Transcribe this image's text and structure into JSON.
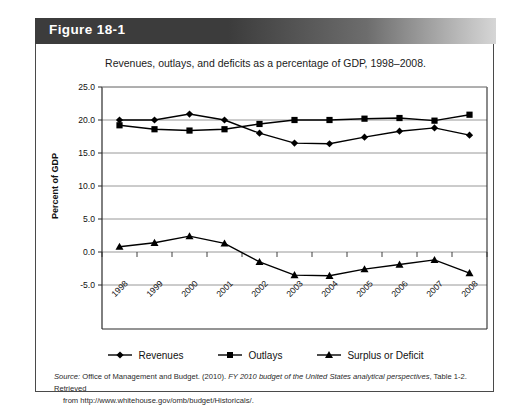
{
  "figure": {
    "label": "Figure 18-1",
    "caption": "Revenues, outlays, and deficits as a percentage of GDP, 1998–2008."
  },
  "source": {
    "prefix": "Source:",
    "text_before_title": " Office of Management and Budget. (2010). ",
    "title": "FY 2010 budget of the United States analytical perspectives",
    "text_after_title": ", Table 1-2. Retrieved",
    "line2": "from http://www.whitehouse.gov/omb/budget/Historicals/."
  },
  "legend": {
    "items": [
      {
        "label": "Revenues",
        "marker": "diamond",
        "color": "#000000"
      },
      {
        "label": "Outlays",
        "marker": "square",
        "color": "#000000"
      },
      {
        "label": "Surplus or Deficit",
        "marker": "triangle",
        "color": "#000000"
      }
    ]
  },
  "axes": {
    "y_label": "Percent of GDP",
    "y_ticks": [
      "25.0",
      "20.0",
      "15.0",
      "10.0",
      "5.0",
      "0.0",
      "-5.0"
    ],
    "x_ticks": [
      "1998",
      "1999",
      "2000",
      "2001",
      "2002",
      "2003",
      "2004",
      "2005",
      "2006",
      "2007",
      "2008"
    ]
  },
  "chart_data": {
    "type": "line",
    "title": "Revenues, outlays, and deficits as a percentage of GDP, 1998–2008.",
    "xlabel": "",
    "ylabel": "Percent of GDP",
    "ylim": [
      -5.0,
      25.0
    ],
    "ytick_step": 5.0,
    "grid": true,
    "legend_position": "bottom",
    "categories": [
      "1998",
      "1999",
      "2000",
      "2001",
      "2002",
      "2003",
      "2004",
      "2005",
      "2006",
      "2007",
      "2008"
    ],
    "series": [
      {
        "name": "Revenues",
        "marker": "diamond",
        "values": [
          20.0,
          20.0,
          20.9,
          20.0,
          18.0,
          16.5,
          16.4,
          17.4,
          18.3,
          18.8,
          17.7
        ]
      },
      {
        "name": "Outlays",
        "marker": "square",
        "values": [
          19.2,
          18.6,
          18.4,
          18.6,
          19.4,
          20.0,
          20.0,
          20.2,
          20.3,
          19.9,
          20.8
        ]
      },
      {
        "name": "Surplus or Deficit",
        "marker": "triangle",
        "values": [
          0.8,
          1.4,
          2.4,
          1.3,
          -1.5,
          -3.5,
          -3.6,
          -2.6,
          -1.9,
          -1.2,
          -3.2
        ]
      }
    ]
  }
}
